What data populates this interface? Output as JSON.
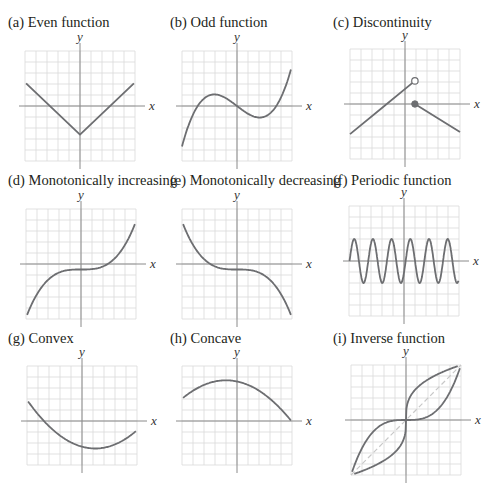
{
  "header_clipped_text": "",
  "panels": [
    {
      "id": "a",
      "title": "(a) Even function",
      "x_label": "x",
      "y_label": "y"
    },
    {
      "id": "b",
      "title": "(b) Odd function",
      "x_label": "x",
      "y_label": "y"
    },
    {
      "id": "c",
      "title": "(c) Discontinuity",
      "x_label": "x",
      "y_label": "y"
    },
    {
      "id": "d",
      "title": "(d) Monotonically increasing",
      "x_label": "x",
      "y_label": "y"
    },
    {
      "id": "e",
      "title": "(e) Monotonically decreasing",
      "x_label": "x",
      "y_label": "y"
    },
    {
      "id": "f",
      "title": "(f) Periodic function",
      "x_label": "x",
      "y_label": "y"
    },
    {
      "id": "g",
      "title": "(g) Convex",
      "x_label": "x",
      "y_label": "y"
    },
    {
      "id": "h",
      "title": "(h) Concave",
      "x_label": "x",
      "y_label": "y"
    },
    {
      "id": "i",
      "title": "(i) Inverse function",
      "x_label": "x",
      "y_label": "y"
    }
  ],
  "colors": {
    "curve": "#6d6e71",
    "grid": "#d9d9d9",
    "axis": "#8a8a8a",
    "identity_dashed": "#c8c8c8",
    "text": "#231f20"
  }
}
